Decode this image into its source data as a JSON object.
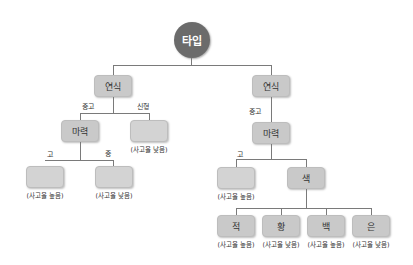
{
  "diagram": {
    "type": "decision-tree",
    "root": {
      "label": "타입"
    },
    "left": {
      "node": "연식",
      "edges": {
        "used": "중고",
        "new": "신형"
      },
      "used_node": "마력",
      "new_leaf": {
        "label": "",
        "note": "(사고율 낮음)"
      },
      "power_edges": {
        "high": "고",
        "mid": "중"
      },
      "high_leaf": {
        "label": "",
        "note": "(사고율 높음)"
      },
      "mid_leaf": {
        "label": "",
        "note": "(사고율 낮음)"
      }
    },
    "right": {
      "node": "연식",
      "edges": {
        "used": "중고"
      },
      "used_node": "마력",
      "power_edges": {
        "high": "고"
      },
      "high_leaf": {
        "label": "",
        "note": "(사고율 높음)"
      },
      "color_node": "색",
      "colors": [
        {
          "label": "적",
          "note": "(사고율 높음)"
        },
        {
          "label": "황",
          "note": "(사고율 낮음)"
        },
        {
          "label": "백",
          "note": "(사고율 높음)"
        },
        {
          "label": "은",
          "note": "(사고율 낮음)"
        }
      ]
    }
  },
  "colors": {
    "root": "#6b6b6b",
    "node": "#c9c9c9",
    "line": "#7a7a7a"
  }
}
